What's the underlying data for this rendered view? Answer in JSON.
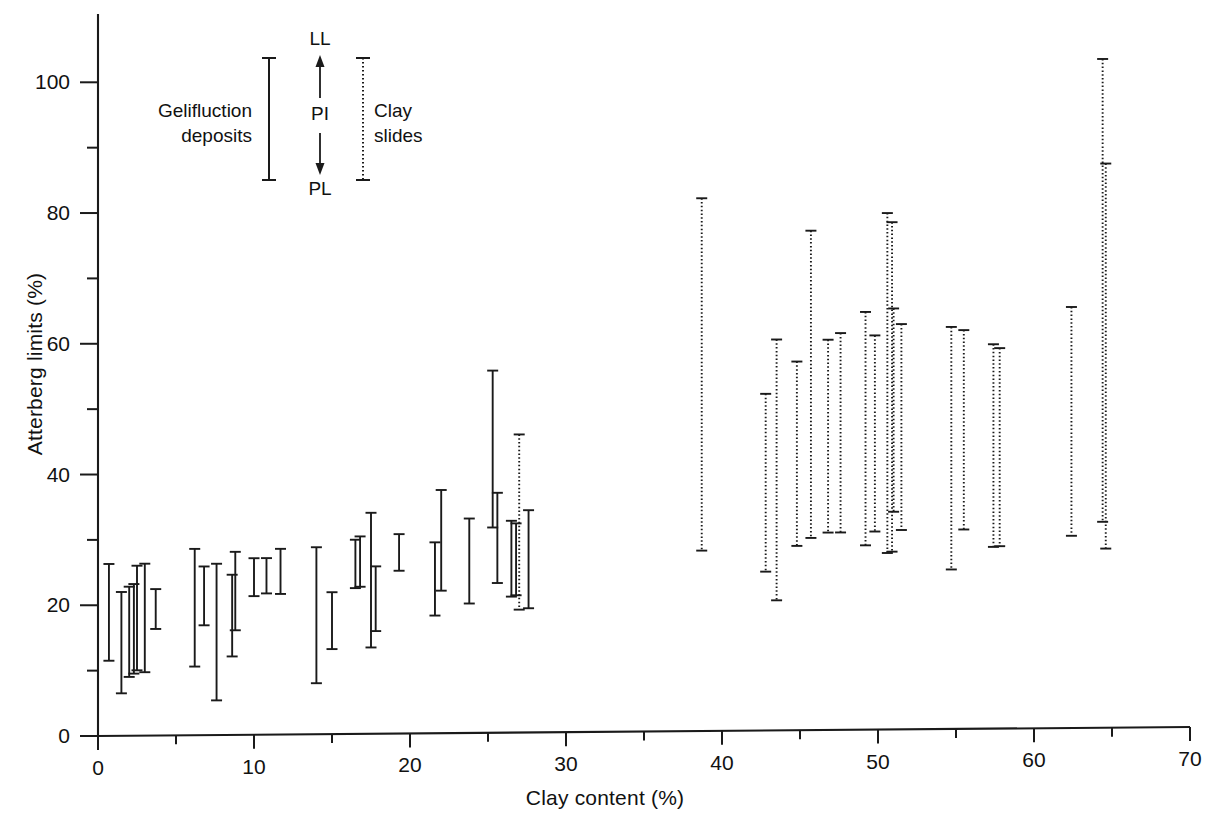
{
  "chart_data": {
    "type": "bar",
    "title": "",
    "xlabel": "Clay content (%)",
    "ylabel": "Atterberg limits (%)",
    "xlim": [
      0,
      70
    ],
    "ylim": [
      0,
      108
    ],
    "xticks": [
      0,
      10,
      20,
      30,
      40,
      50,
      60,
      70
    ],
    "xminorticks": [
      5,
      15,
      25,
      35,
      45,
      55,
      65
    ],
    "yticks": [
      0,
      20,
      40,
      60,
      80,
      100
    ],
    "yminorticks": [
      10,
      30,
      50,
      70,
      90
    ],
    "grid": false,
    "legend_position": "upper-left-inside",
    "series": [
      {
        "name": "Gelifluction deposits",
        "style": "solid",
        "color": "#1a1a1a",
        "bars": [
          {
            "x": 0.7,
            "pl": 11.5,
            "ll": 26.3
          },
          {
            "x": 1.5,
            "pl": 6.5,
            "ll": 22.0
          },
          {
            "x": 2.0,
            "pl": 9.0,
            "ll": 22.8
          },
          {
            "x": 2.3,
            "pl": 9.5,
            "ll": 23.2
          },
          {
            "x": 2.5,
            "pl": 10.0,
            "ll": 26.0
          },
          {
            "x": 3.0,
            "pl": 9.7,
            "ll": 26.3
          },
          {
            "x": 3.7,
            "pl": 16.3,
            "ll": 22.4
          },
          {
            "x": 6.2,
            "pl": 10.5,
            "ll": 28.5
          },
          {
            "x": 6.8,
            "pl": 16.8,
            "ll": 25.8
          },
          {
            "x": 7.6,
            "pl": 5.3,
            "ll": 26.2
          },
          {
            "x": 8.6,
            "pl": 12.0,
            "ll": 24.5
          },
          {
            "x": 8.8,
            "pl": 16.0,
            "ll": 28.0
          },
          {
            "x": 10.0,
            "pl": 21.2,
            "ll": 27.0
          },
          {
            "x": 10.8,
            "pl": 21.6,
            "ll": 27.0
          },
          {
            "x": 11.7,
            "pl": 21.5,
            "ll": 28.4
          },
          {
            "x": 14.0,
            "pl": 7.8,
            "ll": 28.6
          },
          {
            "x": 15.0,
            "pl": 13.0,
            "ll": 21.7
          },
          {
            "x": 16.5,
            "pl": 22.3,
            "ll": 29.7
          },
          {
            "x": 16.8,
            "pl": 22.5,
            "ll": 30.2
          },
          {
            "x": 17.5,
            "pl": 13.2,
            "ll": 33.8
          },
          {
            "x": 17.8,
            "pl": 15.7,
            "ll": 25.6
          },
          {
            "x": 19.3,
            "pl": 24.9,
            "ll": 30.5
          },
          {
            "x": 21.6,
            "pl": 18.0,
            "ll": 29.2
          },
          {
            "x": 22.0,
            "pl": 21.8,
            "ll": 37.2
          },
          {
            "x": 23.8,
            "pl": 19.8,
            "ll": 32.8
          },
          {
            "x": 25.3,
            "pl": 31.4,
            "ll": 55.4
          },
          {
            "x": 25.6,
            "pl": 22.9,
            "ll": 36.7
          },
          {
            "x": 26.5,
            "pl": 20.8,
            "ll": 32.4
          },
          {
            "x": 26.8,
            "pl": 21.0,
            "ll": 32.0
          },
          {
            "x": 27.6,
            "pl": 19.0,
            "ll": 34.0
          }
        ]
      },
      {
        "name": "Clay slides",
        "style": "dotted",
        "color": "#1a1a1a",
        "bars": [
          {
            "x": 27.0,
            "pl": 18.8,
            "ll": 45.6
          },
          {
            "x": 38.7,
            "pl": 27.6,
            "ll": 81.5
          },
          {
            "x": 42.8,
            "pl": 24.3,
            "ll": 51.5
          },
          {
            "x": 43.5,
            "pl": 19.9,
            "ll": 59.8
          },
          {
            "x": 44.8,
            "pl": 28.2,
            "ll": 56.4
          },
          {
            "x": 45.7,
            "pl": 29.4,
            "ll": 76.4
          },
          {
            "x": 46.8,
            "pl": 30.2,
            "ll": 59.7
          },
          {
            "x": 47.6,
            "pl": 30.2,
            "ll": 60.7
          },
          {
            "x": 49.2,
            "pl": 28.2,
            "ll": 63.9
          },
          {
            "x": 49.8,
            "pl": 30.3,
            "ll": 60.3
          },
          {
            "x": 50.6,
            "pl": 27.0,
            "ll": 79.0
          },
          {
            "x": 50.9,
            "pl": 27.2,
            "ll": 77.6
          },
          {
            "x": 51.0,
            "pl": 33.3,
            "ll": 64.4
          },
          {
            "x": 51.5,
            "pl": 30.5,
            "ll": 62.0
          },
          {
            "x": 54.7,
            "pl": 24.4,
            "ll": 61.5
          },
          {
            "x": 55.5,
            "pl": 30.5,
            "ll": 61.0
          },
          {
            "x": 57.4,
            "pl": 27.8,
            "ll": 58.8
          },
          {
            "x": 57.8,
            "pl": 27.9,
            "ll": 58.2
          },
          {
            "x": 62.4,
            "pl": 29.4,
            "ll": 64.4
          },
          {
            "x": 64.4,
            "pl": 31.5,
            "ll": 102.3
          },
          {
            "x": 64.6,
            "pl": 27.4,
            "ll": 86.3
          }
        ]
      }
    ]
  },
  "axes": {
    "y_title": "Atterberg limits (%)",
    "x_title": "Clay content (%)",
    "y_tick_labels": [
      "0",
      "20",
      "40",
      "60",
      "80",
      "100"
    ],
    "x_tick_labels": [
      "0",
      "10",
      "20",
      "30",
      "40",
      "50",
      "60",
      "70"
    ]
  },
  "legend": {
    "gelifluction_label": "Gelifluction\ndeposits",
    "clay_label": "Clay\nslides",
    "ll_label": "LL",
    "pi_label": "PI",
    "pl_label": "PL",
    "gelifluction_style": "solid",
    "clay_style": "dotted",
    "ink_color": "#1a1a1a"
  }
}
